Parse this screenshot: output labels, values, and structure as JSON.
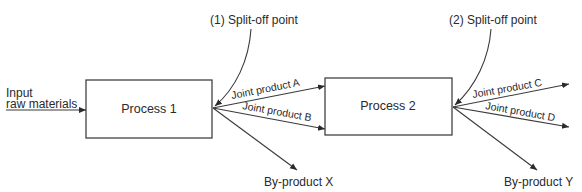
{
  "diagram": {
    "input": {
      "line1": "Input",
      "line2": "raw materials"
    },
    "process1": {
      "label": "Process 1"
    },
    "process2": {
      "label": "Process 2"
    },
    "split1": {
      "label": "(1) Split-off point"
    },
    "split2": {
      "label": "(2) Split-off point"
    },
    "joint_products": {
      "a": "Joint product A",
      "b": "Joint product B",
      "c": "Joint product C",
      "d": "Joint product D"
    },
    "byproducts": {
      "x": "By-product X",
      "y": "By-product Y"
    },
    "colors": {
      "line": "#3a3a3a",
      "text": "#2a2a2a",
      "background": "#ffffff"
    }
  }
}
